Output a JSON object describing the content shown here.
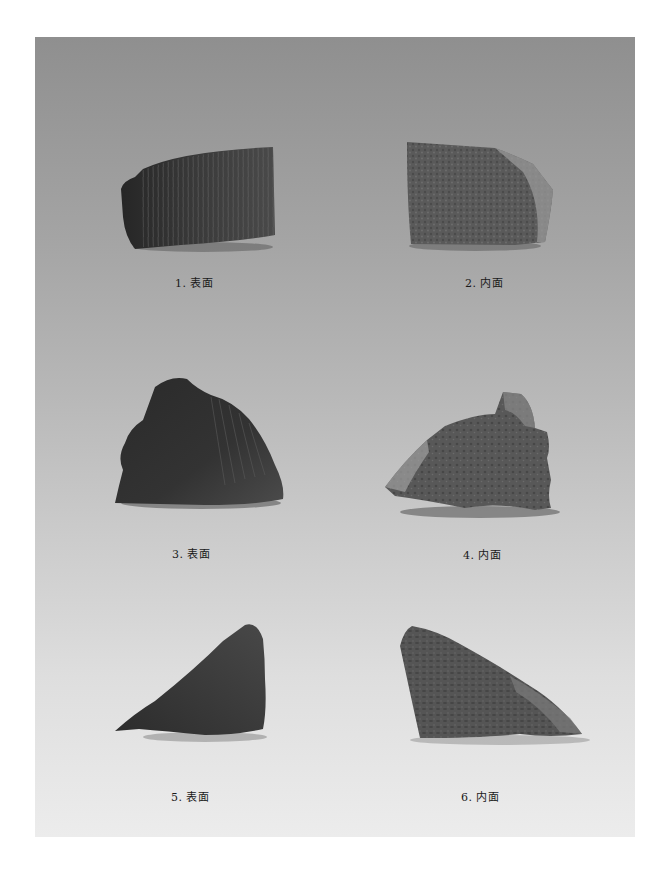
{
  "plate": {
    "background_top": "#8f8f8f",
    "background_bottom": "#ececec",
    "figures": [
      {
        "number": "1",
        "caption": "1. 表面",
        "view": "surface"
      },
      {
        "number": "2",
        "caption": "2. 内面",
        "view": "interior"
      },
      {
        "number": "3",
        "caption": "3. 表面",
        "view": "surface"
      },
      {
        "number": "4",
        "caption": "4. 内面",
        "view": "interior"
      },
      {
        "number": "5",
        "caption": "5. 表面",
        "view": "surface"
      },
      {
        "number": "6",
        "caption": "6. 内面",
        "view": "interior"
      }
    ]
  }
}
